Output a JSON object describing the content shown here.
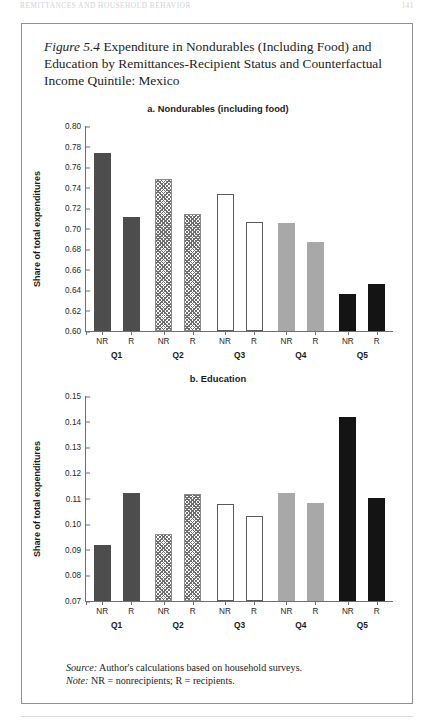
{
  "running_head": {
    "title": "REMITTANCES AND HOUSEHOLD BEHAVIOR",
    "page": "141"
  },
  "figure": {
    "number": "Figure 5.4",
    "caption": " Expenditure in Nondurables (Including Food) and Education by Remittances-Recipient Status and Counterfactual Income Quintile: Mexico"
  },
  "notes": {
    "source_label": "Source:",
    "source_text": " Author's calculations based on household surveys.",
    "note_label": "Note:",
    "note_text": " NR = nonrecipients; R = recipients."
  },
  "chart_data": [
    {
      "id": "panel-a",
      "type": "bar",
      "title": "a. Nondurables (including food)",
      "xlabel": "",
      "ylabel": "Share of total expenditures",
      "ylim": [
        0.6,
        0.8
      ],
      "ytick_step": 0.02,
      "yticks": [
        "0.80",
        "0.78",
        "0.76",
        "0.74",
        "0.72",
        "0.70",
        "0.68",
        "0.66",
        "0.64",
        "0.62",
        "0.60"
      ],
      "grid": false,
      "legend": "none",
      "groups": [
        "Q1",
        "Q2",
        "Q3",
        "Q4",
        "Q5"
      ],
      "subcategories": [
        "NR",
        "R"
      ],
      "group_styles": [
        "solid-dark",
        "hatch",
        "white",
        "gray",
        "black"
      ],
      "categories": [
        "Q1 NR",
        "Q1 R",
        "Q2 NR",
        "Q2 R",
        "Q3 NR",
        "Q3 R",
        "Q4 NR",
        "Q4 R",
        "Q5 NR",
        "Q5 R"
      ],
      "values": [
        0.774,
        0.711,
        0.748,
        0.714,
        0.734,
        0.706,
        0.705,
        0.687,
        0.636,
        0.646
      ]
    },
    {
      "id": "panel-b",
      "type": "bar",
      "title": "b. Education",
      "xlabel": "",
      "ylabel": "Share of total expenditures",
      "ylim": [
        0.07,
        0.15
      ],
      "ytick_step": 0.01,
      "yticks": [
        "0.15",
        "0.14",
        "0.13",
        "0.12",
        "0.11",
        "0.10",
        "0.09",
        "0.08",
        "0.07"
      ],
      "grid": false,
      "legend": "none",
      "groups": [
        "Q1",
        "Q2",
        "Q3",
        "Q4",
        "Q5"
      ],
      "subcategories": [
        "NR",
        "R"
      ],
      "group_styles": [
        "solid-dark",
        "hatch",
        "white",
        "gray",
        "black"
      ],
      "categories": [
        "Q1 NR",
        "Q1 R",
        "Q2 NR",
        "Q2 R",
        "Q3 NR",
        "Q3 R",
        "Q4 NR",
        "Q4 R",
        "Q5 NR",
        "Q5 R"
      ],
      "values": [
        0.092,
        0.112,
        0.0963,
        0.1118,
        0.1077,
        0.1032,
        0.112,
        0.1081,
        0.1418,
        0.1103
      ]
    }
  ]
}
